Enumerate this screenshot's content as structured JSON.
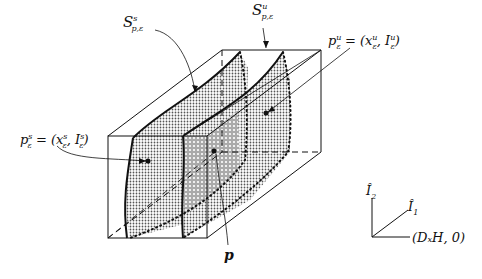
{
  "diagram": {
    "type": "3d-box-with-invariant-manifolds",
    "labels": {
      "stable_manifold": {
        "base": "S",
        "sup": "s",
        "sub": "p,ε"
      },
      "unstable_manifold": {
        "base": "S",
        "sup": "u",
        "sub": "p,ε"
      },
      "point_unstable": {
        "text": "p",
        "sup": "u",
        "sub": "ε",
        "rhs": "= (x",
        "rhs_sup": "u",
        "rhs_sub": "ε",
        "rhs2": ", I",
        "rhs2_sup": "u",
        "rhs2_sub": "ε",
        "close": ")"
      },
      "point_stable": {
        "text": "p",
        "sup": "s",
        "sub": "ε",
        "rhs": "= (x",
        "rhs_sup": "s",
        "rhs_sub": "ε",
        "rhs2": ", I",
        "rhs2_sup": "s",
        "rhs2_sub": "ε",
        "close": ")"
      },
      "point_p": "p"
    },
    "axes": {
      "vertical": {
        "base": "Î",
        "sub": "2"
      },
      "diagonal": {
        "base": "Î",
        "sub": "1"
      },
      "horizontal": "(DₓH, 0)"
    },
    "colors": {
      "line": "#111111",
      "fill_light": "#d8d8d8",
      "fill_dark": "#b8b8b8",
      "background": "#ffffff"
    }
  }
}
